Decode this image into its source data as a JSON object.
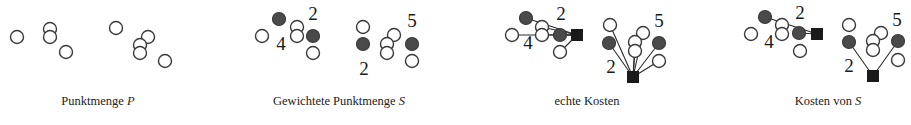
{
  "panels": [
    {
      "id": "punktmenge",
      "caption": {
        "text": "Punktmenge ",
        "var": "P",
        "cx": 98
      },
      "open_points": [
        [
          17,
          37
        ],
        [
          50,
          29
        ],
        [
          50,
          37
        ],
        [
          66,
          52
        ],
        [
          116,
          28
        ],
        [
          148,
          37
        ],
        [
          140,
          45
        ],
        [
          140,
          53
        ],
        [
          165,
          61
        ]
      ],
      "filled_points": [],
      "squares": [],
      "edges": [],
      "weights": []
    },
    {
      "id": "gewichtete-punktmenge",
      "caption": {
        "text": "Gewichtete Punktmenge ",
        "var": "S",
        "cx": 339
      },
      "open_points": [
        [
          262,
          36
        ],
        [
          297,
          27
        ],
        [
          297,
          36
        ],
        [
          313,
          53
        ],
        [
          363,
          27
        ],
        [
          394,
          35
        ],
        [
          387,
          44
        ],
        [
          387,
          53
        ],
        [
          412,
          61
        ]
      ],
      "filled_points": [
        [
          279,
          19
        ],
        [
          313,
          36
        ],
        [
          363,
          44
        ],
        [
          412,
          44
        ]
      ],
      "squares": [],
      "edges": [],
      "weights": [
        {
          "label": "2",
          "x": 313,
          "y": 20
        },
        {
          "label": "4",
          "x": 281,
          "y": 50
        },
        {
          "label": "2",
          "x": 364,
          "y": 75
        },
        {
          "label": "5",
          "x": 412,
          "y": 27
        }
      ]
    },
    {
      "id": "echte-kosten",
      "caption": {
        "text": "echte Kosten",
        "var": "",
        "cx": 587
      },
      "open_points": [
        [
          512,
          35
        ],
        [
          542,
          27
        ],
        [
          542,
          35
        ],
        [
          560,
          52
        ],
        [
          610,
          25
        ],
        [
          643,
          33
        ],
        [
          635,
          42
        ],
        [
          635,
          51
        ],
        [
          659,
          61
        ]
      ],
      "filled_points": [
        [
          526,
          18
        ],
        [
          560,
          35
        ],
        [
          609,
          43
        ],
        [
          659,
          43
        ]
      ],
      "squares": [
        [
          577,
          35
        ],
        [
          633,
          77
        ]
      ],
      "edges": [
        [
          [
            512,
            35
          ],
          [
            577,
            35
          ]
        ],
        [
          [
            526,
            18
          ],
          [
            577,
            35
          ]
        ],
        [
          [
            542,
            27
          ],
          [
            577,
            35
          ]
        ],
        [
          [
            542,
            35
          ],
          [
            577,
            35
          ]
        ],
        [
          [
            560,
            35
          ],
          [
            577,
            35
          ]
        ],
        [
          [
            560,
            52
          ],
          [
            577,
            35
          ]
        ],
        [
          [
            610,
            25
          ],
          [
            633,
            77
          ]
        ],
        [
          [
            609,
            43
          ],
          [
            633,
            77
          ]
        ],
        [
          [
            643,
            33
          ],
          [
            633,
            77
          ]
        ],
        [
          [
            635,
            42
          ],
          [
            633,
            77
          ]
        ],
        [
          [
            635,
            51
          ],
          [
            633,
            77
          ]
        ],
        [
          [
            659,
            43
          ],
          [
            633,
            77
          ]
        ],
        [
          [
            659,
            61
          ],
          [
            633,
            77
          ]
        ]
      ],
      "weights": [
        {
          "label": "2",
          "x": 561,
          "y": 20
        },
        {
          "label": "4",
          "x": 528,
          "y": 49
        },
        {
          "label": "2",
          "x": 611,
          "y": 73
        },
        {
          "label": "5",
          "x": 659,
          "y": 27
        }
      ]
    },
    {
      "id": "kosten-von-s",
      "caption": {
        "text": "Kosten von ",
        "var": "S",
        "cx": 828
      },
      "open_points": [
        [
          751,
          34
        ],
        [
          782,
          25
        ],
        [
          782,
          34
        ],
        [
          800,
          51
        ],
        [
          849,
          25
        ],
        [
          881,
          33
        ],
        [
          873,
          41
        ],
        [
          873,
          50
        ],
        [
          898,
          60
        ]
      ],
      "filled_points": [
        [
          765,
          17
        ],
        [
          799,
          33
        ],
        [
          849,
          42
        ],
        [
          898,
          41
        ]
      ],
      "squares": [
        [
          817,
          34
        ],
        [
          873,
          76
        ]
      ],
      "edges": [
        [
          [
            765,
            17
          ],
          [
            817,
            34
          ]
        ],
        [
          [
            799,
            33
          ],
          [
            817,
            34
          ]
        ],
        [
          [
            849,
            42
          ],
          [
            873,
            76
          ]
        ],
        [
          [
            898,
            41
          ],
          [
            873,
            76
          ]
        ]
      ],
      "weights": [
        {
          "label": "2",
          "x": 800,
          "y": 19
        },
        {
          "label": "4",
          "x": 769,
          "y": 48
        },
        {
          "label": "2",
          "x": 849,
          "y": 72
        },
        {
          "label": "5",
          "x": 897,
          "y": 26
        }
      ]
    }
  ],
  "legend": {
    "open_point": "unweighted point",
    "filled_point": "weighted point",
    "square": "center"
  }
}
